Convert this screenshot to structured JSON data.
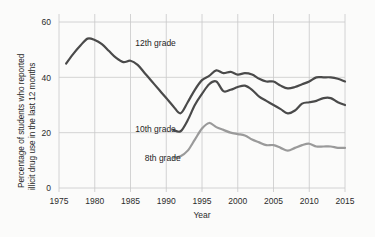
{
  "chart_data": {
    "type": "line",
    "title": "",
    "xlabel": "Year",
    "ylabel_line1": "Percentage of students who reported",
    "ylabel_line2": "illicit drug use in the last 12 months",
    "xlim": [
      1975,
      2015
    ],
    "ylim": [
      0,
      60
    ],
    "grid": true,
    "legend_position": "inline-annotations",
    "xticks": [
      "1975",
      "1980",
      "1985",
      "1990",
      "1995",
      "2000",
      "2005",
      "2010",
      "2015"
    ],
    "xtick_values": [
      1975,
      1980,
      1985,
      1990,
      1995,
      2000,
      2005,
      2010,
      2015
    ],
    "yticks": [
      "0",
      "20",
      "40",
      "60"
    ],
    "ytick_values": [
      0,
      20,
      40,
      60
    ],
    "colors": {
      "grade12": "#4a4a4a",
      "grade10": "#4a4a4a",
      "grade8": "#9a9a9a",
      "gridline": "#c9c9c9",
      "background": "#fbfbfa",
      "text": "#1f1f1f"
    },
    "series": [
      {
        "name": "12th grade",
        "label": "12th grade",
        "color": "#4a4a4a",
        "label_x": 1988.5,
        "label_y": 52.5,
        "x": [
          1976,
          1977,
          1978,
          1979,
          1980,
          1981,
          1982,
          1983,
          1984,
          1985,
          1986,
          1987,
          1988,
          1989,
          1990,
          1991,
          1992,
          1993,
          1994,
          1995,
          1996,
          1997,
          1998,
          1999,
          2000,
          2001,
          2002,
          2003,
          2004,
          2005,
          2006,
          2007,
          2008,
          2009,
          2010,
          2011,
          2012,
          2013,
          2014,
          2015
        ],
        "values": [
          45.0,
          48.5,
          51.5,
          54.0,
          53.5,
          52.0,
          49.5,
          47.0,
          45.5,
          46.0,
          44.5,
          41.5,
          38.5,
          35.5,
          32.5,
          29.5,
          27.0,
          31.0,
          35.5,
          39.0,
          40.5,
          42.5,
          41.5,
          42.0,
          41.0,
          41.5,
          41.0,
          39.5,
          38.5,
          38.5,
          37.0,
          36.0,
          36.5,
          37.5,
          38.5,
          40.0,
          40.0,
          40.0,
          39.5,
          38.5
        ]
      },
      {
        "name": "10th grade",
        "label": "10th grade",
        "color": "#4a4a4a",
        "label_x": 1988.5,
        "label_y": 21.5,
        "x": [
          1991,
          1992,
          1993,
          1994,
          1995,
          1996,
          1997,
          1998,
          1999,
          2000,
          2001,
          2002,
          2003,
          2004,
          2005,
          2006,
          2007,
          2008,
          2009,
          2010,
          2011,
          2012,
          2013,
          2014,
          2015
        ],
        "values": [
          21.0,
          20.5,
          24.5,
          30.0,
          34.0,
          37.5,
          38.5,
          35.0,
          35.5,
          36.5,
          37.0,
          35.5,
          33.0,
          31.5,
          30.0,
          28.5,
          27.0,
          28.0,
          30.5,
          31.0,
          31.5,
          32.5,
          32.5,
          31.0,
          30.0
        ]
      },
      {
        "name": "8th grade",
        "label": "8th grade",
        "color": "#9a9a9a",
        "label_x": 1989.5,
        "label_y": 11.0,
        "x": [
          1991,
          1992,
          1993,
          1994,
          1995,
          1996,
          1997,
          1998,
          1999,
          2000,
          2001,
          2002,
          2003,
          2004,
          2005,
          2006,
          2007,
          2008,
          2009,
          2010,
          2011,
          2012,
          2013,
          2014,
          2015
        ],
        "values": [
          11.0,
          11.5,
          13.5,
          17.5,
          21.5,
          23.5,
          22.0,
          21.0,
          20.0,
          19.5,
          19.0,
          17.5,
          16.5,
          15.5,
          15.5,
          14.5,
          13.5,
          14.5,
          15.5,
          16.0,
          15.0,
          15.0,
          15.0,
          14.5,
          14.5
        ]
      }
    ]
  }
}
